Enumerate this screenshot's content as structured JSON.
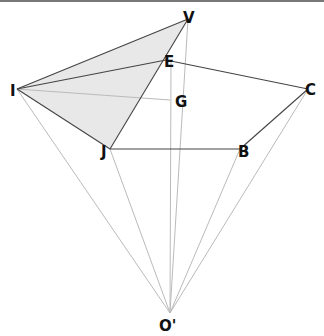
{
  "diagram": {
    "type": "geometry-perspective",
    "colors": {
      "edge": "#444444",
      "projection": "#bbbbbb",
      "fill": "#e8e8e8",
      "label": "#111111",
      "topbar": "#777777"
    },
    "points": {
      "V": {
        "x": 188,
        "y": 19,
        "label": "V",
        "lx": 183,
        "ly": 22
      },
      "E": {
        "x": 166,
        "y": 60,
        "label": "E",
        "lx": 165,
        "ly": 68
      },
      "I": {
        "x": 17,
        "y": 89,
        "label": "I",
        "lx": 10,
        "ly": 95
      },
      "G": {
        "x": 170,
        "y": 100,
        "label": "G",
        "lx": 175,
        "ly": 107
      },
      "C": {
        "x": 308,
        "y": 89,
        "label": "C",
        "lx": 308,
        "ly": 95
      },
      "J": {
        "x": 110,
        "y": 149,
        "label": "J",
        "lx": 101,
        "ly": 156
      },
      "B": {
        "x": 240,
        "y": 149,
        "label": "B",
        "lx": 238,
        "ly": 156
      },
      "O": {
        "x": 170,
        "y": 313,
        "label": "O'",
        "lx": 160,
        "ly": 330
      }
    },
    "labels": [
      "V",
      "E",
      "I",
      "G",
      "C",
      "J",
      "B",
      "O'"
    ]
  }
}
